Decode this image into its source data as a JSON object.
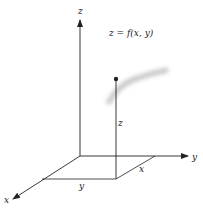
{
  "diagram": {
    "type": "3d-coordinate-axes",
    "equation_label": "z = f(x, y)",
    "axes": {
      "z_label": "z",
      "y_label": "y",
      "x_label": "x"
    },
    "point": {
      "height_label": "z",
      "base_x_label": "x",
      "base_y_label": "y"
    },
    "colors": {
      "line": "#222222",
      "surface_shadow": "#bbbbbb",
      "background": "#ffffff"
    }
  }
}
